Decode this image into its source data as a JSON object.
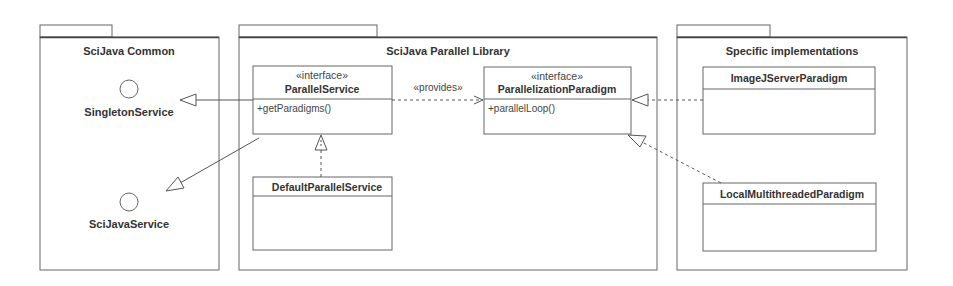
{
  "diagram": {
    "type": "uml-package-diagram",
    "colors": {
      "stroke": "#555555",
      "background": "#ffffff",
      "text": "#333333"
    },
    "packages": [
      {
        "id": "scijava-common",
        "title": "SciJava Common"
      },
      {
        "id": "scijava-parallel-library",
        "title": "SciJava Parallel Library"
      },
      {
        "id": "specific-implementations",
        "title": "Specific implementations"
      }
    ],
    "interfaces_lollipop": [
      {
        "id": "singleton-service",
        "label": "SingletonService"
      },
      {
        "id": "scijava-service",
        "label": "SciJavaService"
      }
    ],
    "classes": [
      {
        "id": "parallel-service",
        "stereotype": "«interface»",
        "name": "ParallelService",
        "members": [
          "+getParadigms()"
        ]
      },
      {
        "id": "parallelization-paradigm",
        "stereotype": "«interface»",
        "name": "ParallelizationParadigm",
        "members": [
          "+parallelLoop()"
        ]
      },
      {
        "id": "default-parallel-service",
        "stereotype": "",
        "name": "DefaultParallelService",
        "members": []
      },
      {
        "id": "imagej-server-paradigm",
        "stereotype": "",
        "name": "ImageJServerParadigm",
        "members": []
      },
      {
        "id": "local-multithreaded-paradigm",
        "stereotype": "",
        "name": "LocalMultithreadedParadigm",
        "members": []
      }
    ],
    "edges": [
      {
        "from": "ParallelService",
        "to": "SingletonService",
        "kind": "generalization"
      },
      {
        "from": "ParallelService",
        "to": "SciJavaService",
        "kind": "generalization"
      },
      {
        "from": "ParallelService",
        "to": "ParallelizationParadigm",
        "kind": "dependency",
        "label": "«provides»"
      },
      {
        "from": "DefaultParallelService",
        "to": "ParallelService",
        "kind": "realization"
      },
      {
        "from": "ImageJServerParadigm",
        "to": "ParallelizationParadigm",
        "kind": "realization"
      },
      {
        "from": "LocalMultithreadedParadigm",
        "to": "ParallelizationParadigm",
        "kind": "realization"
      }
    ],
    "provides_label": "«provides»"
  }
}
